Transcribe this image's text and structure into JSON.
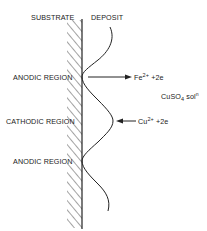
{
  "diagram": {
    "headers": {
      "substrate": "SUBSTRATE",
      "deposit": "DEPOSIT"
    },
    "regions": [
      {
        "label": "ANODIC REGION",
        "y": 76
      },
      {
        "label": "CATHODIC REGION",
        "y": 121
      },
      {
        "label": "ANODIC REGION",
        "y": 161
      }
    ],
    "reactions": {
      "outgoing": {
        "base": "Fe",
        "sup": "2+",
        "rest": " +2e"
      },
      "incoming": {
        "base": "Cu",
        "sup": "2+",
        "rest": " +2e"
      }
    },
    "solution": {
      "base": "CuSO",
      "sub": "4",
      "rest": " sol",
      "sup": "n"
    },
    "colors": {
      "ink": "#222222",
      "background": "#ffffff"
    }
  }
}
